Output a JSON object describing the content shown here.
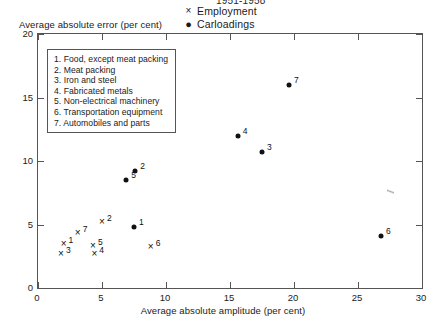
{
  "chart_data": {
    "type": "scatter",
    "title": "1951-1958",
    "xlabel": "Average absolute amplitude (per cent)",
    "ylabel": "Average absolute error (per cent)",
    "xlim": [
      0,
      30
    ],
    "ylim": [
      0,
      20
    ],
    "xticks": [
      "0",
      "5",
      "10",
      "15",
      "20",
      "25",
      "30"
    ],
    "yticks": [
      "0",
      "5",
      "10",
      "15",
      "20"
    ],
    "grid": false,
    "legend_position": "top-center",
    "series": [
      {
        "name": "Employment",
        "marker": "x",
        "points": [
          {
            "label": "1",
            "x": 2.0,
            "y": 3.5
          },
          {
            "label": "2",
            "x": 5.0,
            "y": 5.2
          },
          {
            "label": "3",
            "x": 1.8,
            "y": 2.7
          },
          {
            "label": "4",
            "x": 4.4,
            "y": 2.7
          },
          {
            "label": "5",
            "x": 4.3,
            "y": 3.3
          },
          {
            "label": "6",
            "x": 8.8,
            "y": 3.2
          },
          {
            "label": "7",
            "x": 3.1,
            "y": 4.3
          }
        ]
      },
      {
        "name": "Carloadings",
        "marker": "dot",
        "points": [
          {
            "label": "1",
            "x": 7.5,
            "y": 4.8
          },
          {
            "label": "2",
            "x": 7.6,
            "y": 9.2
          },
          {
            "label": "3",
            "x": 17.5,
            "y": 10.7
          },
          {
            "label": "4",
            "x": 15.6,
            "y": 12.0
          },
          {
            "label": "5",
            "x": 6.9,
            "y": 8.5
          },
          {
            "label": "6",
            "x": 26.8,
            "y": 4.1
          },
          {
            "label": "7",
            "x": 19.6,
            "y": 16.0
          }
        ]
      }
    ],
    "key_entries": [
      "1. Food, except meat packing",
      "2. Meat packing",
      "3. Iron and steel",
      "4. Fabricated metals",
      "5. Non-electrical machinery",
      "6. Transportation equipment",
      "7. Automobiles and parts"
    ],
    "marker_glyphs": {
      "x": "×",
      "dot": "●"
    }
  }
}
